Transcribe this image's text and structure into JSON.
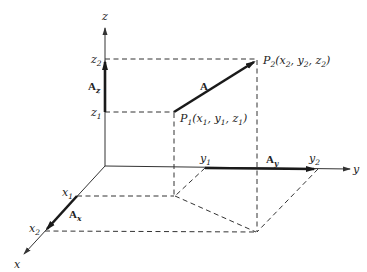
{
  "diagram": {
    "type": "3d-vector-components",
    "axes": {
      "x": {
        "label": "x"
      },
      "y": {
        "label": "y"
      },
      "z": {
        "label": "z"
      }
    },
    "points": {
      "p1": {
        "name": "P",
        "sub": "1",
        "coords": "(x",
        "c1": "1",
        "sep1": ", y",
        "c2": "1",
        "sep2": ", z",
        "c3": "1",
        "close": ")"
      },
      "p2": {
        "name": "P",
        "sub": "2",
        "coords": "(x",
        "c1": "2",
        "sep1": ", y",
        "c2": "2",
        "sep2": ", z",
        "c3": "2",
        "close": ")"
      }
    },
    "ticks": {
      "z1": {
        "base": "z",
        "sub": "1"
      },
      "z2": {
        "base": "z",
        "sub": "2"
      },
      "y1": {
        "base": "y",
        "sub": "1"
      },
      "y2": {
        "base": "y",
        "sub": "2"
      },
      "x1": {
        "base": "x",
        "sub": "1"
      },
      "x2": {
        "base": "x",
        "sub": "2"
      }
    },
    "vectors": {
      "A": {
        "label": "A"
      },
      "Ax": {
        "base": "A",
        "sub": "x"
      },
      "Ay": {
        "base": "A",
        "sub": "y"
      },
      "Az": {
        "base": "A",
        "sub": "z"
      }
    }
  }
}
